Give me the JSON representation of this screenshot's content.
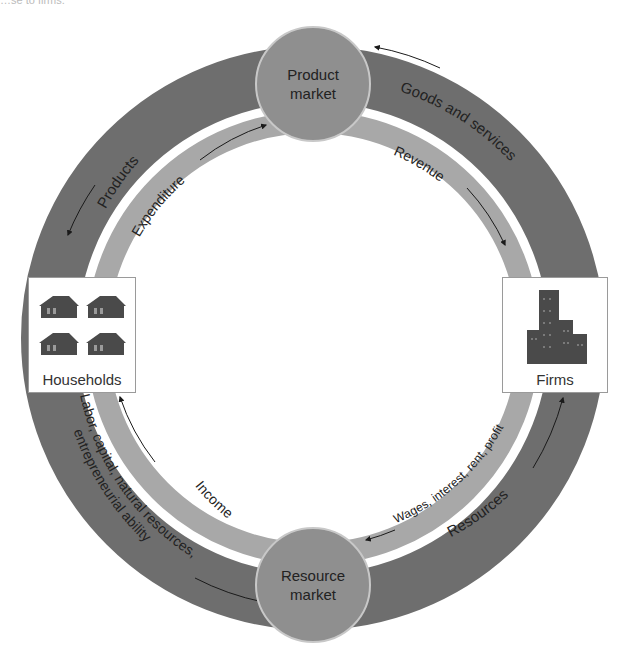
{
  "caption_fragment": "…se to firms.",
  "colors": {
    "outer_ring": "#6e6e6e",
    "inner_ring": "#a8a8a8",
    "market_circle": "#8f8f8f",
    "text": "#222222",
    "box_border": "#9a9a9a",
    "icon": "#4a4a4a"
  },
  "markets": {
    "product": {
      "line1": "Product",
      "line2": "market"
    },
    "resource": {
      "line1": "Resource",
      "line2": "market"
    }
  },
  "sectors": {
    "households": {
      "label": "Households",
      "icon": "house-icon"
    },
    "firms": {
      "label": "Firms",
      "icon": "building-icon"
    }
  },
  "flows": {
    "outer": {
      "products": "Products",
      "goods_services": "Goods and services",
      "resources": "Resources",
      "factors_line1": "Labor, capital, natural resources,",
      "factors_line2": "entrepreneurial ability"
    },
    "inner": {
      "expenditure": "Expenditure",
      "revenue": "Revenue",
      "factor_payments": "Wages, interest, rent, profit",
      "income": "Income"
    }
  }
}
